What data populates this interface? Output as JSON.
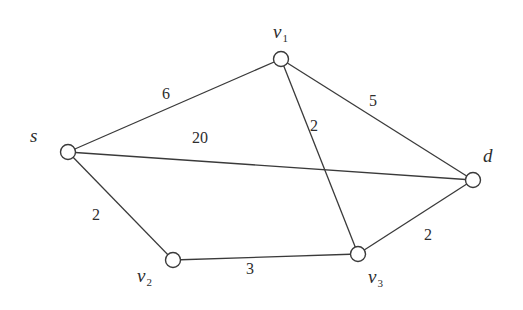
{
  "graph": {
    "type": "weighted-undirected-graph",
    "nodes": [
      {
        "id": "s",
        "name": "s",
        "sub": ""
      },
      {
        "id": "v1",
        "name": "v",
        "sub": "1"
      },
      {
        "id": "d",
        "name": "d",
        "sub": ""
      },
      {
        "id": "v2",
        "name": "v",
        "sub": "2"
      },
      {
        "id": "v3",
        "name": "v",
        "sub": "3"
      }
    ],
    "edges": [
      {
        "from": "s",
        "to": "v1",
        "weight": "6"
      },
      {
        "from": "s",
        "to": "d",
        "weight": "20"
      },
      {
        "from": "s",
        "to": "v2",
        "weight": "2"
      },
      {
        "from": "v1",
        "to": "d",
        "weight": "5"
      },
      {
        "from": "v1",
        "to": "v3",
        "weight": "2"
      },
      {
        "from": "v2",
        "to": "v3",
        "weight": "3"
      },
      {
        "from": "v3",
        "to": "d",
        "weight": "2"
      }
    ]
  }
}
